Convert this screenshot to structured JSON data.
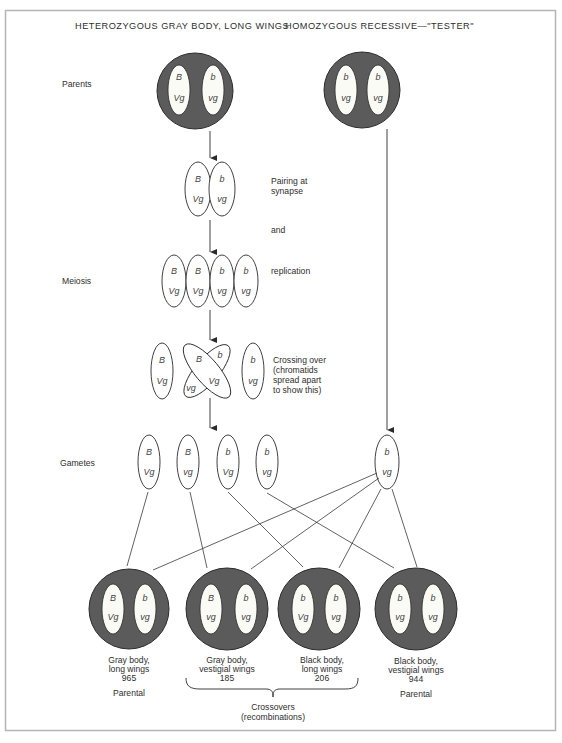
{
  "headers": {
    "left": "HETEROZYGOUS GRAY BODY, LONG WINGS",
    "right": "HOMOZYGOUS RECESSIVE—\"TESTER\""
  },
  "row_labels": {
    "parents": "Parents",
    "meiosis": "Meiosis",
    "gametes": "Gametes"
  },
  "step_notes": {
    "pairing_line1": "Pairing at",
    "pairing_line2": "synapse",
    "and": "and",
    "replication": "replication",
    "crossing_line1": "Crossing over",
    "crossing_line2": "(chromatids",
    "crossing_line3": "spread apart",
    "crossing_line4": "to show this)"
  },
  "parent_hetero": {
    "chromosomes": [
      {
        "top": "B",
        "bottom": "Vg"
      },
      {
        "top": "b",
        "bottom": "vg"
      }
    ]
  },
  "parent_tester": {
    "chromosomes": [
      {
        "top": "b",
        "bottom": "vg"
      },
      {
        "top": "b",
        "bottom": "vg"
      }
    ]
  },
  "synapse": [
    {
      "top": "B",
      "bottom": "Vg"
    },
    {
      "top": "b",
      "bottom": "vg"
    }
  ],
  "replication": [
    {
      "top": "B",
      "bottom": "Vg"
    },
    {
      "top": "B",
      "bottom": "Vg"
    },
    {
      "top": "b",
      "bottom": "vg"
    },
    {
      "top": "b",
      "bottom": "vg"
    }
  ],
  "crossing_over": {
    "left": {
      "top": "B",
      "bottom": "Vg"
    },
    "cross_a": {
      "top": "B",
      "bottom": "Vg"
    },
    "cross_b": {
      "top": "b",
      "bottom": "vg"
    },
    "right": {
      "top": "b",
      "bottom": "vg"
    }
  },
  "gametes": [
    {
      "top": "B",
      "bottom": "Vg"
    },
    {
      "top": "B",
      "bottom": "vg"
    },
    {
      "top": "b",
      "bottom": "Vg"
    },
    {
      "top": "b",
      "bottom": "vg"
    }
  ],
  "tester_gamete": {
    "top": "b",
    "bottom": "vg"
  },
  "offspring": [
    {
      "chromosomes": [
        {
          "top": "B",
          "bottom": "Vg"
        },
        {
          "top": "b",
          "bottom": "vg"
        }
      ],
      "line1": "Gray body,",
      "line2": "long wings",
      "count": "965",
      "type": "Parental"
    },
    {
      "chromosomes": [
        {
          "top": "B",
          "bottom": "vg"
        },
        {
          "top": "b",
          "bottom": "vg"
        }
      ],
      "line1": "Gray body,",
      "line2": "vestigial wings",
      "count": "185",
      "type": ""
    },
    {
      "chromosomes": [
        {
          "top": "b",
          "bottom": "Vg"
        },
        {
          "top": "b",
          "bottom": "vg"
        }
      ],
      "line1": "Black body,",
      "line2": "long wings",
      "count": "206",
      "type": ""
    },
    {
      "chromosomes": [
        {
          "top": "b",
          "bottom": "vg"
        },
        {
          "top": "b",
          "bottom": "vg"
        }
      ],
      "line1": "Black body,",
      "line2": "vestigial wings",
      "count": "944",
      "type": "Parental"
    }
  ],
  "crossovers_label": {
    "line1": "Crossovers",
    "line2": "(recombinations)"
  },
  "colors": {
    "cell_fill": "#5b5b5b",
    "chromosome_fill": "#fbfbf6",
    "stroke": "#2b2b2b",
    "frame": "#b5b5b5"
  }
}
